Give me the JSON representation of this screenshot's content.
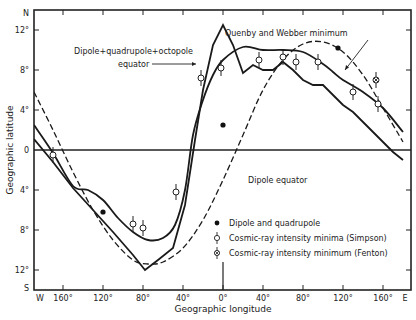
{
  "chart_data": {
    "type": "line",
    "title": "",
    "xlabel": "Geographic longitude",
    "ylabel": "Geographic latitude",
    "xlim": [
      -180,
      180
    ],
    "ylim": [
      -14,
      14
    ],
    "grid": false,
    "x_ticks": [
      {
        "value": -180,
        "label": "W"
      },
      {
        "value": -160,
        "label": "160°"
      },
      {
        "value": -120,
        "label": "120°"
      },
      {
        "value": -80,
        "label": "80°"
      },
      {
        "value": -40,
        "label": "40°"
      },
      {
        "value": 0,
        "label": "0°"
      },
      {
        "value": 40,
        "label": "40°"
      },
      {
        "value": 80,
        "label": "80°"
      },
      {
        "value": 120,
        "label": "120°"
      },
      {
        "value": 160,
        "label": "160°"
      },
      {
        "value": 180,
        "label": "E"
      }
    ],
    "y_ticks": [
      {
        "value": 14,
        "label": "N"
      },
      {
        "value": 12,
        "label": "12°"
      },
      {
        "value": 8,
        "label": "8°"
      },
      {
        "value": 4,
        "label": "4°"
      },
      {
        "value": 0,
        "label": "0"
      },
      {
        "value": -4,
        "label": "4°"
      },
      {
        "value": -8,
        "label": "8°"
      },
      {
        "value": -12,
        "label": "12°"
      },
      {
        "value": -14,
        "label": "S"
      }
    ],
    "series": [
      {
        "name": "Dipole equator",
        "style": "dashed",
        "x": [
          -189,
          -170,
          -150,
          -130,
          -110,
          -90,
          -75,
          -60,
          -40,
          -20,
          0,
          20,
          40,
          60,
          80,
          100,
          120,
          140,
          160,
          180
        ],
        "y": [
          5.8,
          2.0,
          -2.2,
          -6.0,
          -9.0,
          -11.0,
          -11.4,
          -11.2,
          -9.8,
          -7.0,
          -3.0,
          1.5,
          6.0,
          9.0,
          10.6,
          10.8,
          9.8,
          7.5,
          4.2,
          0.8
        ]
      },
      {
        "name": "Dipole + quadrupole + octopole equator",
        "style": "solid",
        "x": [
          -189,
          -170,
          -150,
          -130,
          -110,
          -90,
          -78,
          -65,
          -50,
          -38,
          -28,
          -20,
          -10,
          0,
          10,
          20,
          30,
          40,
          50,
          60,
          70,
          80,
          90,
          100,
          110,
          120,
          130,
          140,
          150,
          160,
          170,
          180
        ],
        "y": [
          1.1,
          -1.2,
          -3.8,
          -6.0,
          -8.2,
          -10.5,
          -12.0,
          -11.0,
          -9.8,
          -5.5,
          1.0,
          6.0,
          10.5,
          12.5,
          10.5,
          7.7,
          8.5,
          8.0,
          8.0,
          8.8,
          8.0,
          7.0,
          6.5,
          6.5,
          5.5,
          4.5,
          3.8,
          2.8,
          1.8,
          0.8,
          -0.2,
          -1.0
        ]
      },
      {
        "name": "Quenby and Webber minimum",
        "style": "solid",
        "x": [
          -189,
          -170,
          -150,
          -135,
          -120,
          -105,
          -90,
          -75,
          -60,
          -48,
          -38,
          -30,
          -20,
          -10,
          0,
          20,
          40,
          60,
          80,
          100,
          110,
          120,
          140,
          160,
          180
        ],
        "y": [
          2.5,
          -0.3,
          -3.6,
          -4.0,
          -5.0,
          -6.8,
          -8.2,
          -9.0,
          -8.8,
          -7.5,
          -4.0,
          1.5,
          5.0,
          7.5,
          9.0,
          10.3,
          10.0,
          10.0,
          9.8,
          8.6,
          7.8,
          7.0,
          5.8,
          4.2,
          1.8
        ]
      }
    ],
    "points": [
      {
        "name": "Dipole and quadrupole",
        "marker": "filled-circle",
        "data": [
          [
            -120,
            -6.2
          ],
          [
            0,
            2.5
          ],
          [
            115,
            10.2
          ]
        ]
      },
      {
        "name": "Cosmic-ray intensity minima (Simpson)",
        "marker": "open-circle-errorbar",
        "data": [
          [
            -170,
            -0.5
          ],
          [
            -90,
            -7.4
          ],
          [
            -80,
            -7.8
          ],
          [
            -47,
            -4.2
          ],
          [
            -22,
            7.2
          ],
          [
            -2,
            8.2
          ],
          [
            36,
            9.0
          ],
          [
            60,
            9.3
          ],
          [
            73,
            8.8
          ],
          [
            95,
            8.8
          ],
          [
            130,
            5.8
          ],
          [
            155,
            4.6
          ]
        ]
      },
      {
        "name": "Cosmic-ray intensity minimum (Fenton)",
        "marker": "crossed-circle-errorbar",
        "data": [
          [
            153,
            7.0
          ]
        ]
      }
    ],
    "annotations": [
      {
        "text": "Quenby and Webber minimum",
        "x": 225,
        "y": 36
      },
      {
        "text": "Dipole+quadrupole+octopole",
        "x": 74,
        "y": 54
      },
      {
        "text": "equator",
        "x": 118,
        "y": 67
      },
      {
        "text": "Dipole equator",
        "x": 248,
        "y": 183
      }
    ],
    "legend": {
      "position": "lower-right",
      "entries": [
        "Dipole and quadrupole",
        "Cosmic-ray intensity minima (Simpson)",
        "Cosmic-ray intensity minimum (Fenton)"
      ]
    }
  }
}
